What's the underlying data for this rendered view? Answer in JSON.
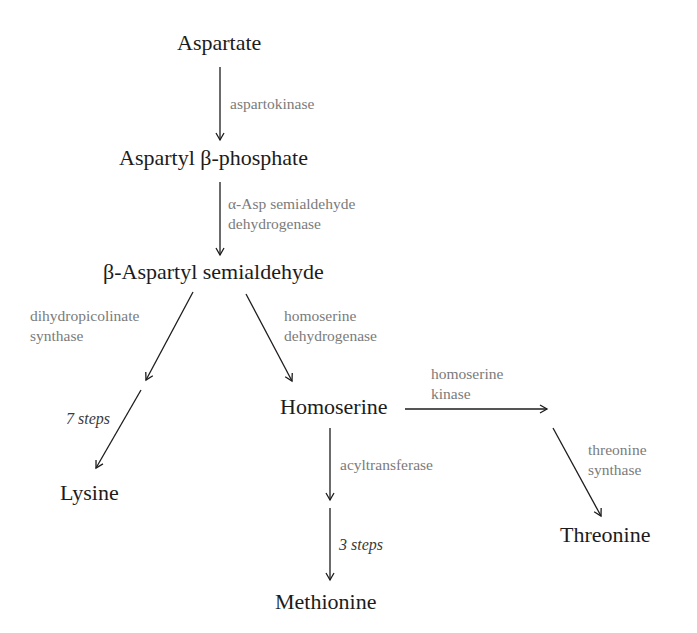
{
  "diagram": {
    "nodes": {
      "aspartate": "Aspartate",
      "aspartyl_phosphate": "Aspartyl β-phosphate",
      "aspartyl_semialdehyde": "β-Aspartyl semialdehyde",
      "lysine": "Lysine",
      "homoserine": "Homoserine",
      "methionine": "Methionine",
      "threonine": "Threonine"
    },
    "enzymes": {
      "aspartokinase": [
        "aspartokinase"
      ],
      "asp_semialdehyde_dh": [
        "α-Asp semialdehyde",
        "dehydrogenase"
      ],
      "dihydropicolinate_synthase": [
        "dihydropicolinate",
        "synthase"
      ],
      "homoserine_dh": [
        "homoserine",
        "dehydrogenase"
      ],
      "homoserine_kinase": [
        "homoserine",
        "kinase"
      ],
      "acyltransferase": [
        "acyltransferase"
      ],
      "threonine_synthase": [
        "threonine",
        "synthase"
      ]
    },
    "steps": {
      "lysine_steps": "7 steps",
      "methionine_steps": "3 steps"
    },
    "colors": {
      "node_text": "#1c1c1c",
      "enzyme_text": "#7b7b7b",
      "arrow": "#1c1c1c"
    }
  }
}
